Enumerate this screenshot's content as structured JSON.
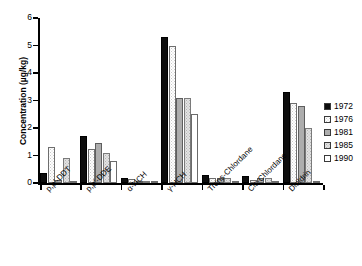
{
  "chart_data": {
    "type": "bar",
    "title": "",
    "xlabel": "",
    "ylabel": "Concentration (µg/kg)",
    "ylim": [
      0,
      6
    ],
    "yticks": [
      "0",
      "1",
      "2",
      "3",
      "4",
      "5",
      "6"
    ],
    "grid": false,
    "legend_position": "right",
    "categories": [
      "p,p'-DDT",
      "p,p'-DDE",
      "α-HCH",
      "γ-HCH",
      "Trans-Chlordane",
      "Cis-Chlordane",
      "Dieldrin"
    ],
    "series": [
      {
        "name": "1972",
        "color": "#0d0d0d",
        "values": [
          0.35,
          1.7,
          0.2,
          5.3,
          0.28,
          0.25,
          3.3
        ]
      },
      {
        "name": "1976",
        "color": "#ffffff",
        "values": [
          1.3,
          1.25,
          0.15,
          5.0,
          0.18,
          0.12,
          2.9
        ]
      },
      {
        "name": "1981",
        "color": "#adadad",
        "values": [
          0.1,
          1.45,
          0.05,
          3.1,
          0.2,
          0.18,
          2.8
        ]
      },
      {
        "name": "1985",
        "color": "#e2e2e2",
        "values": [
          0.9,
          1.1,
          0.05,
          3.1,
          0.18,
          0.18,
          2.0
        ]
      },
      {
        "name": "1990",
        "color": "#ffffff",
        "values": [
          0.05,
          0.8,
          0.03,
          2.5,
          0.03,
          0.02,
          0.02
        ]
      }
    ]
  },
  "legend": {
    "items": [
      {
        "label": "1972"
      },
      {
        "label": "1976"
      },
      {
        "label": "1981"
      },
      {
        "label": "1985"
      },
      {
        "label": "1990"
      }
    ]
  }
}
